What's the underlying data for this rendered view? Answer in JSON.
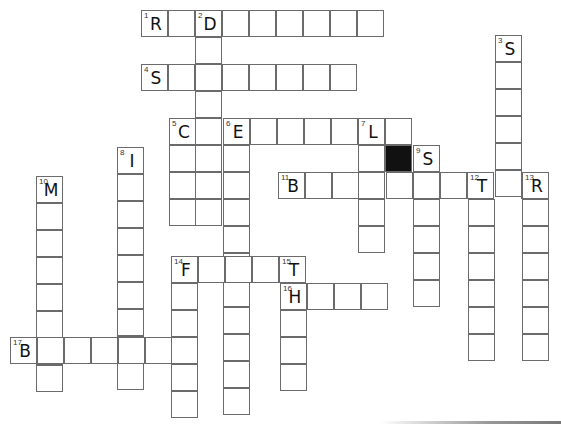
{
  "puzzle": {
    "cell_size": 27,
    "words": [
      {
        "num": "1",
        "dir": "across",
        "x": 141,
        "y": 10,
        "len": 9,
        "first_letter": "R"
      },
      {
        "num": "2",
        "dir": "down",
        "x": 195,
        "y": 10,
        "len": 8,
        "first_letter": "D"
      },
      {
        "num": "3",
        "dir": "down",
        "x": 495,
        "y": 35,
        "len": 6,
        "first_letter": "S"
      },
      {
        "num": "4",
        "dir": "across",
        "x": 141,
        "y": 64,
        "len": 8,
        "first_letter": "S"
      },
      {
        "num": "5",
        "dir": "across",
        "x": 169,
        "y": 118,
        "len": 9,
        "first_letter": "C"
      },
      {
        "num": "5d",
        "dir": "down",
        "x": 169,
        "y": 118,
        "len": 4,
        "first_letter": ""
      },
      {
        "num": "6",
        "dir": "down",
        "x": 223,
        "y": 118,
        "len": 11,
        "first_letter": "E"
      },
      {
        "num": "7",
        "dir": "down",
        "x": 358,
        "y": 118,
        "len": 5,
        "first_letter": "L"
      },
      {
        "num": "8",
        "dir": "down",
        "x": 117,
        "y": 147,
        "len": 9,
        "first_letter": "I"
      },
      {
        "num": "9",
        "dir": "down",
        "x": 413,
        "y": 145,
        "len": 6,
        "first_letter": "S"
      },
      {
        "num": "10",
        "dir": "down",
        "x": 36,
        "y": 176,
        "len": 8,
        "first_letter": "M"
      },
      {
        "num": "11",
        "dir": "across",
        "x": 278,
        "y": 172,
        "len": 10,
        "first_letter": "B"
      },
      {
        "num": "12",
        "dir": "down",
        "x": 468,
        "y": 172,
        "len": 7,
        "first_letter": "T"
      },
      {
        "num": "13",
        "dir": "down",
        "x": 522,
        "y": 172,
        "len": 7,
        "first_letter": "R"
      },
      {
        "num": "14",
        "dir": "across",
        "x": 171,
        "y": 256,
        "len": 5,
        "first_letter": "F"
      },
      {
        "num": "14d",
        "dir": "down",
        "x": 171,
        "y": 256,
        "len": 6,
        "first_letter": ""
      },
      {
        "num": "15",
        "dir": "down",
        "x": 280,
        "y": 256,
        "len": 5,
        "first_letter": "T"
      },
      {
        "num": "16",
        "dir": "across",
        "x": 280,
        "y": 283,
        "len": 4,
        "first_letter": "H"
      },
      {
        "num": "17",
        "dir": "across",
        "x": 10,
        "y": 337,
        "len": 7,
        "first_letter": "B"
      }
    ],
    "black_cells": [
      {
        "x": 385,
        "y": 145
      }
    ]
  }
}
